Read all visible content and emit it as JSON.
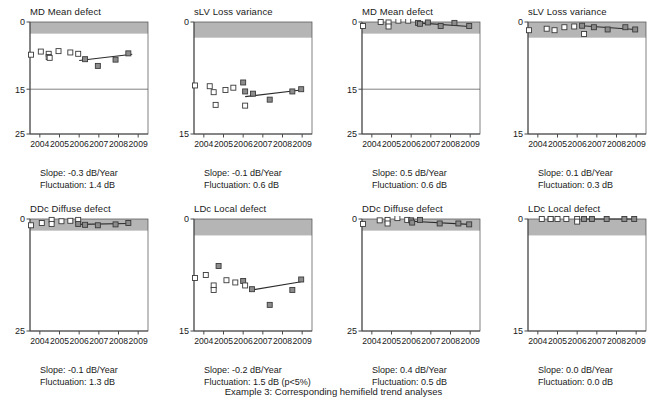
{
  "figure": {
    "caption": "Example 3: Corresponding hemifield trend analyses",
    "colors": {
      "band": "#b5b5b5",
      "axis": "#4a4a4a",
      "marker_open_fill": "#ffffff",
      "marker_filled_fill": "#8c8c8c",
      "marker_stroke": "#3a3a3a",
      "trend_line": "#2b2b2b"
    },
    "xaxis": {
      "label": "",
      "ticks": [
        "2004",
        "2005",
        "2006",
        "2007",
        "2008",
        "2009"
      ],
      "xlim": [
        2003.5,
        2009.5
      ]
    },
    "slope_prefix": "Slope: ",
    "slope_suffix": " dB/Year",
    "fluctuation_prefix": "Fluctuation: ",
    "fluctuation_suffix": " dB"
  },
  "chart_data": [
    {
      "id": "md-left",
      "type": "scatter",
      "title": "MD Mean defect",
      "xlabel": "",
      "ylabel": "",
      "ylim": [
        0,
        25
      ],
      "y_inverted": true,
      "yticks": [
        0,
        15,
        25
      ],
      "ytick_labels": [
        "0",
        "15",
        "25"
      ],
      "normal_band": [
        0,
        2.6
      ],
      "grid": true,
      "slope": "-0.3",
      "fluctuation": "1.4",
      "significance": "",
      "slope_text": "Slope: -0.3 dB/Year",
      "fluctuation_text": "Fluctuation: 1.4 dB",
      "x": [
        2003.55,
        2004.05,
        2004.45,
        2004.45,
        2004.5,
        2004.95,
        2005.55,
        2005.95,
        2006.3,
        2006.95,
        2007.85,
        2008.5
      ],
      "y": [
        7.3,
        6.6,
        7.1,
        7.8,
        8.0,
        6.5,
        6.8,
        7.1,
        8.3,
        9.8,
        8.4,
        7.0
      ],
      "filled": [
        false,
        false,
        false,
        false,
        false,
        false,
        false,
        false,
        true,
        true,
        true,
        true
      ],
      "trend": {
        "x": [
          2006.0,
          2008.7
        ],
        "y": [
          8.6,
          7.2
        ]
      }
    },
    {
      "id": "slv-left",
      "type": "scatter",
      "title": "sLV Loss variance",
      "xlabel": "",
      "ylabel": "",
      "ylim": [
        0,
        15
      ],
      "y_inverted": true,
      "yticks": [
        0,
        15
      ],
      "ytick_labels": [
        "0",
        "15"
      ],
      "normal_band": [
        0,
        2.1
      ],
      "grid": false,
      "slope": "-0.1",
      "fluctuation": "0.6",
      "significance": "",
      "slope_text": "Slope: -0.1 dB/Year",
      "fluctuation_text": "Fluctuation: 0.6 dB",
      "x": [
        2003.55,
        2004.3,
        2004.5,
        2004.6,
        2005.1,
        2005.5,
        2006.0,
        2006.1,
        2006.1,
        2006.5,
        2007.35,
        2008.5,
        2008.95
      ],
      "y": [
        8.5,
        8.6,
        9.4,
        11.1,
        9.1,
        8.8,
        8.1,
        9.3,
        11.2,
        9.6,
        10.4,
        9.3,
        9.0
      ],
      "filled": [
        false,
        false,
        false,
        false,
        false,
        false,
        true,
        true,
        false,
        true,
        true,
        true,
        true
      ],
      "trend": {
        "x": [
          2006.1,
          2008.95
        ],
        "y": [
          10.0,
          9.1
        ]
      }
    },
    {
      "id": "md-right",
      "type": "scatter",
      "title": "MD Mean defect",
      "xlabel": "",
      "ylabel": "",
      "ylim": [
        0,
        25
      ],
      "y_inverted": true,
      "yticks": [
        0,
        15,
        25
      ],
      "ytick_labels": [
        "0",
        "15",
        "25"
      ],
      "normal_band": [
        0,
        2.6
      ],
      "grid": true,
      "slope": "0.5",
      "fluctuation": "0.6",
      "significance": "",
      "slope_text": "Slope: 0.5 dB/Year",
      "fluctuation_text": "Fluctuation: 0.6 dB",
      "x": [
        2003.55,
        2004.45,
        2004.85,
        2004.85,
        2005.35,
        2005.85,
        2006.35,
        2006.45,
        2006.85,
        2007.5,
        2008.2,
        2008.95
      ],
      "y": [
        0.9,
        0.0,
        0.1,
        1.0,
        -0.3,
        -0.3,
        0.2,
        0.4,
        0.1,
        0.9,
        0.2,
        0.9
      ],
      "filled": [
        false,
        false,
        false,
        false,
        false,
        false,
        true,
        true,
        true,
        true,
        true,
        true
      ],
      "trend": {
        "x": [
          2006.35,
          2008.95
        ],
        "y": [
          0.2,
          1.0
        ]
      }
    },
    {
      "id": "slv-right",
      "type": "scatter",
      "title": "sLV Loss variance",
      "xlabel": "",
      "ylabel": "",
      "ylim": [
        0,
        15
      ],
      "y_inverted": true,
      "yticks": [
        0,
        15
      ],
      "ytick_labels": [
        "0",
        "15"
      ],
      "normal_band": [
        0,
        2.1
      ],
      "grid": false,
      "slope": "0.1",
      "fluctuation": "0.3",
      "significance": "",
      "slope_text": "Slope: 0.1 dB/Year",
      "fluctuation_text": "Fluctuation: 0.3 dB",
      "x": [
        2003.55,
        2004.45,
        2004.85,
        2005.35,
        2005.85,
        2006.25,
        2006.35,
        2006.85,
        2007.55,
        2008.45,
        2008.95
      ],
      "y": [
        1.1,
        0.9,
        1.1,
        0.7,
        0.6,
        0.5,
        1.6,
        0.7,
        1.0,
        0.7,
        1.0
      ],
      "filled": [
        false,
        false,
        false,
        false,
        false,
        true,
        false,
        true,
        true,
        true,
        true
      ],
      "trend": {
        "x": [
          2006.25,
          2008.95
        ],
        "y": [
          0.5,
          1.0
        ]
      }
    },
    {
      "id": "ddc-left",
      "type": "scatter",
      "title": "DDc Diffuse defect",
      "xlabel": "",
      "ylabel": "",
      "ylim": [
        0,
        25
      ],
      "y_inverted": true,
      "yticks": [
        0,
        25
      ],
      "ytick_labels": [
        "0",
        "25"
      ],
      "normal_band": [
        0,
        2.6
      ],
      "grid": false,
      "slope": "-0.1",
      "fluctuation": "1.3",
      "significance": "",
      "slope_text": "Slope: -0.1 dB/Year",
      "fluctuation_text": "Fluctuation: 1.3 dB",
      "x": [
        2003.55,
        2004.1,
        2004.6,
        2004.6,
        2005.1,
        2005.55,
        2005.95,
        2005.95,
        2006.3,
        2006.95,
        2007.85,
        2008.5
      ],
      "y": [
        1.4,
        0.9,
        0.2,
        1.1,
        0.5,
        0.4,
        0.2,
        1.1,
        1.3,
        1.4,
        1.2,
        0.9
      ],
      "filled": [
        false,
        false,
        false,
        false,
        false,
        false,
        false,
        true,
        true,
        true,
        true,
        true
      ],
      "trend": {
        "x": [
          2005.95,
          2008.5
        ],
        "y": [
          1.2,
          1.0
        ]
      }
    },
    {
      "id": "ldc-left",
      "type": "scatter",
      "title": "LDc Local defect",
      "xlabel": "",
      "ylabel": "",
      "ylim": [
        0,
        15
      ],
      "y_inverted": true,
      "yticks": [
        0,
        15
      ],
      "ytick_labels": [
        "0",
        "15"
      ],
      "normal_band": [
        0,
        2.2
      ],
      "grid": false,
      "slope": "-0.2",
      "fluctuation": "1.5",
      "significance": "(p<5%)",
      "slope_text": "Slope: -0.2 dB/Year",
      "fluctuation_text": "Fluctuation: 1.5 dB (p<5%)",
      "x": [
        2003.55,
        2004.1,
        2004.5,
        2004.5,
        2004.75,
        2005.15,
        2005.6,
        2006.0,
        2006.1,
        2006.45,
        2007.35,
        2008.5,
        2008.95
      ],
      "y": [
        7.9,
        7.5,
        8.9,
        9.5,
        6.3,
        8.2,
        8.5,
        8.3,
        8.9,
        9.4,
        11.5,
        9.5,
        8.1
      ],
      "filled": [
        false,
        false,
        false,
        false,
        true,
        false,
        false,
        true,
        false,
        true,
        true,
        true,
        true
      ],
      "trend": {
        "x": [
          2006.45,
          2008.95
        ],
        "y": [
          9.5,
          8.4
        ]
      }
    },
    {
      "id": "ddc-right",
      "type": "scatter",
      "title": "DDc Diffuse defect",
      "xlabel": "",
      "ylabel": "",
      "ylim": [
        0,
        25
      ],
      "y_inverted": true,
      "yticks": [
        0,
        25
      ],
      "ytick_labels": [
        "0",
        "25"
      ],
      "normal_band": [
        0,
        2.6
      ],
      "grid": false,
      "slope": "0.4",
      "fluctuation": "0.5",
      "significance": "",
      "slope_text": "Slope: 0.4 dB/Year",
      "fluctuation_text": "Fluctuation: 0.5 dB",
      "x": [
        2003.55,
        2004.4,
        2004.8,
        2004.8,
        2005.3,
        2005.8,
        2006.0,
        2006.05,
        2006.45,
        2007.45,
        2008.4,
        2008.95
      ],
      "y": [
        1.1,
        0.3,
        0.2,
        1.0,
        -0.2,
        0.2,
        0.3,
        0.8,
        0.2,
        1.0,
        1.0,
        1.2
      ],
      "filled": [
        false,
        false,
        false,
        false,
        false,
        false,
        true,
        true,
        true,
        true,
        true,
        true
      ],
      "trend": {
        "x": [
          2006.0,
          2008.95
        ],
        "y": [
          0.5,
          1.2
        ]
      }
    },
    {
      "id": "ldc-right",
      "type": "scatter",
      "title": "LDc Local defect",
      "xlabel": "",
      "ylabel": "",
      "ylim": [
        0,
        15
      ],
      "y_inverted": true,
      "yticks": [
        0,
        15
      ],
      "ytick_labels": [
        "0",
        "15"
      ],
      "normal_band": [
        0,
        2.2
      ],
      "grid": false,
      "slope": "0.0",
      "fluctuation": "0.0",
      "significance": "",
      "slope_text": "Slope: 0.0 dB/Year",
      "fluctuation_text": "Fluctuation: 0.0 dB",
      "x": [
        2004.2,
        2004.65,
        2004.65,
        2005.0,
        2005.45,
        2006.0,
        2006.0,
        2006.35,
        2006.75,
        2007.5,
        2008.4,
        2008.9
      ],
      "y": [
        0.0,
        0.0,
        0.0,
        0.0,
        0.0,
        0.0,
        0.35,
        0.0,
        0.0,
        0.0,
        0.0,
        0.0
      ],
      "filled": [
        false,
        false,
        false,
        false,
        false,
        false,
        false,
        true,
        true,
        true,
        true,
        true
      ],
      "trend": {
        "x": [
          2006.35,
          2008.9
        ],
        "y": [
          0.0,
          0.0
        ]
      }
    }
  ]
}
